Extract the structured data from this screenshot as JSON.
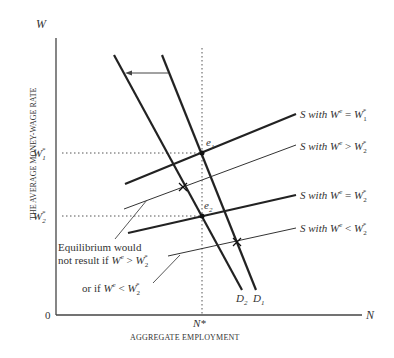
{
  "diagram": {
    "type": "economics-labor-market",
    "y_axis": {
      "symbol": "W",
      "title": "THE AVERAGE MONEY-WAGE RATE",
      "origin": "0"
    },
    "x_axis": {
      "symbol": "N",
      "title": "AGGREGATE EMPLOYMENT"
    },
    "ticks": {
      "w1": {
        "base": "W",
        "sub": "1",
        "sup": "*"
      },
      "w2": {
        "base": "W",
        "sub": "2",
        "sup": "*"
      },
      "nstar": "N*"
    },
    "points": {
      "e1": {
        "base": "e",
        "sub": "1"
      },
      "e2": {
        "base": "e",
        "sub": "2"
      }
    },
    "demand_curves": [
      {
        "id": "D1",
        "base": "D",
        "sub": "1"
      },
      {
        "id": "D2",
        "base": "D",
        "sub": "2"
      }
    ],
    "supply_curves": [
      {
        "id": "s-we-eq-w1",
        "prefix": "S with ",
        "we": "W",
        "we_sup": "e",
        "op": " = ",
        "rhs": "W",
        "rhs_sub": "1",
        "rhs_sup": "*",
        "weight": "thick"
      },
      {
        "id": "s-we-gt-w2",
        "prefix": "S with ",
        "we": "W",
        "we_sup": "e",
        "op": " > ",
        "rhs": "W",
        "rhs_sub": "2",
        "rhs_sup": "*",
        "weight": "thin"
      },
      {
        "id": "s-we-eq-w2",
        "prefix": "S with ",
        "we": "W",
        "we_sup": "e",
        "op": " = ",
        "rhs": "W",
        "rhs_sub": "2",
        "rhs_sup": "*",
        "weight": "thick"
      },
      {
        "id": "s-we-lt-w2",
        "prefix": "S with ",
        "we": "W",
        "we_sup": "e",
        "op": " < ",
        "rhs": "W",
        "rhs_sub": "2",
        "rhs_sup": "*",
        "weight": "thin"
      }
    ],
    "annotations": {
      "line1": "Equilibrium would",
      "line2_prefix": "not result if ",
      "line2_op": " > ",
      "line3_prefix": "or if ",
      "line3_op": " < ",
      "we": "W",
      "we_sup": "e",
      "rhs": "W",
      "rhs_sub": "2",
      "rhs_sup": "*"
    },
    "arrow": "demand shift left from D1 to D2"
  }
}
